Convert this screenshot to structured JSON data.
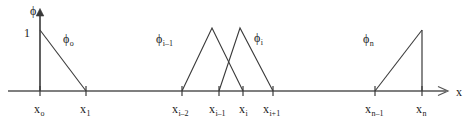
{
  "figure": {
    "kind": "finite-element-hat-basis-functions",
    "background_color": "#ffffff",
    "line_color": "#3a3a3a",
    "axis_color": "#555555",
    "text_color": "#1a1a1a"
  },
  "axes": {
    "y_axis": {
      "label_base": "ϕ",
      "label_sub": "",
      "arrow": true,
      "x_px": 40,
      "top_px": 10,
      "bottom_px": 91
    },
    "x_axis": {
      "label_base": "x",
      "label_sub": "",
      "arrow": true,
      "y_px": 91,
      "left_px": 8,
      "right_px": 452
    },
    "y_tick": {
      "value": "1",
      "y_px": 30
    }
  },
  "nodes": [
    {
      "id": "x0",
      "base": "x",
      "sub": "o",
      "x_px": 40
    },
    {
      "id": "x1",
      "base": "x",
      "sub": "1",
      "x_px": 86
    },
    {
      "id": "xim2",
      "base": "x",
      "sub": "i–2",
      "x_px": 182
    },
    {
      "id": "xim1",
      "base": "x",
      "sub": "i–1",
      "x_px": 219
    },
    {
      "id": "xi",
      "base": "x",
      "sub": "i",
      "x_px": 243
    },
    {
      "id": "xip1",
      "base": "x",
      "sub": "i+1",
      "x_px": 273
    },
    {
      "id": "xnm1",
      "base": "x",
      "sub": "n–1",
      "x_px": 375
    },
    {
      "id": "xn",
      "base": "x",
      "sub": "n",
      "x_px": 422
    }
  ],
  "basis_functions": [
    {
      "id": "phi0",
      "label_base": "ϕ",
      "label_sub": "o",
      "label_x_px": 63,
      "label_y_px": 36,
      "shape": "descending-ramp",
      "peak_x_px": 40,
      "peak_y_px": 30,
      "base_start_x_px": 40,
      "base_end_x_px": 86
    },
    {
      "id": "phi_i_minus_1",
      "label_base": "ϕ",
      "label_sub": "i–1",
      "label_x_px": 156,
      "label_y_px": 36,
      "shape": "triangle",
      "peak_x_px": 212,
      "peak_y_px": 28,
      "base_start_x_px": 182,
      "base_end_x_px": 243
    },
    {
      "id": "phi_i",
      "label_base": "ϕ",
      "label_sub": "i",
      "label_x_px": 254,
      "label_y_px": 34,
      "shape": "triangle",
      "peak_x_px": 240,
      "peak_y_px": 28,
      "base_start_x_px": 219,
      "base_end_x_px": 273
    },
    {
      "id": "phi_n",
      "label_base": "ϕ",
      "label_sub": "n",
      "label_x_px": 363,
      "label_y_px": 35,
      "shape": "ascending-ramp",
      "peak_x_px": 422,
      "peak_y_px": 30,
      "base_start_x_px": 375,
      "base_end_x_px": 422
    }
  ]
}
